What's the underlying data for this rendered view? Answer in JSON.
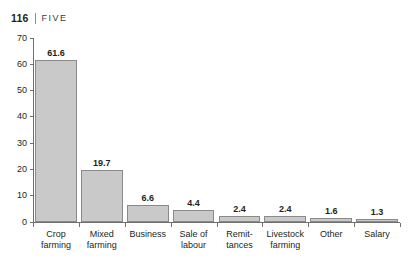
{
  "running_head": {
    "folio": "116",
    "separator": "|",
    "chapter": "FIVE"
  },
  "chart_data": {
    "type": "bar",
    "title": "",
    "subtitle": "",
    "xlabel": "",
    "ylabel": "",
    "ylim": [
      0,
      70
    ],
    "ytick_step": 10,
    "yticks": [
      "0",
      "10",
      "20",
      "30",
      "40",
      "50",
      "60",
      "70"
    ],
    "grid": false,
    "legend": false,
    "orientation": "vertical",
    "categories": [
      "Crop farming",
      "Mixed farming",
      "Business",
      "Sale of labour",
      "Remit-tances",
      "Livestock farming",
      "Other",
      "Salary"
    ],
    "category_lines": [
      [
        "Crop",
        "farming"
      ],
      [
        "Mixed",
        "farming"
      ],
      [
        "Business"
      ],
      [
        "Sale of",
        "labour"
      ],
      [
        "Remit-",
        "tances"
      ],
      [
        "Livestock",
        "farming"
      ],
      [
        "Other"
      ],
      [
        "Salary"
      ]
    ],
    "values": [
      61.6,
      19.7,
      6.6,
      4.4,
      2.4,
      2.4,
      1.6,
      1.3
    ],
    "value_labels": [
      "61.6",
      "19.7",
      "6.6",
      "4.4",
      "2.4",
      "2.4",
      "1.6",
      "1.3"
    ],
    "colors": {
      "bar_fill": "#c9c9c9",
      "bar_stroke": "#8a8a8a",
      "axis": "#6f6f6f",
      "text": "#231f20",
      "background": "#ffffff"
    }
  }
}
